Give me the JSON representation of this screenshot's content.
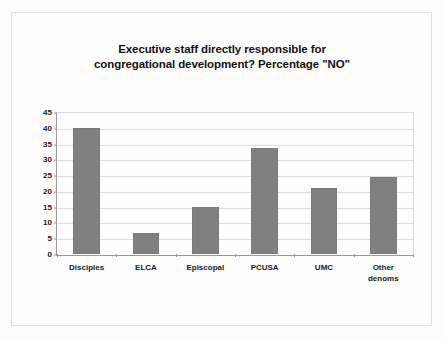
{
  "chart_data": {
    "type": "bar",
    "title": "Executive staff directly responsible for congregational development? Percentage \"NO\"",
    "title_lines": [
      "Executive staff directly responsible for",
      "congregational development? Percentage \"NO\""
    ],
    "xlabel": "",
    "ylabel": "",
    "categories": [
      "Disciples",
      "ELCA",
      "Episcopal",
      "PCUSA",
      "UMC",
      "Other denoms"
    ],
    "category_lines": [
      [
        "Disciples"
      ],
      [
        "ELCA"
      ],
      [
        "Episcopal"
      ],
      [
        "PCUSA"
      ],
      [
        "UMC"
      ],
      [
        "Other",
        "denoms"
      ]
    ],
    "values": [
      40,
      6.8,
      15,
      33.5,
      20.8,
      24.5
    ],
    "ylim": [
      0,
      45
    ],
    "ytick_labels": [
      "45",
      "40",
      "35",
      "30",
      "25",
      "20",
      "15",
      "10",
      "5",
      "0"
    ],
    "ytick_values": [
      45,
      40,
      35,
      30,
      25,
      20,
      15,
      10,
      5,
      0
    ],
    "ytick_step": 5,
    "grid": true,
    "legend": false,
    "bar_color": "#808080",
    "grid_color": "#dedede",
    "axis_color": "#9a9a9a",
    "background_color": "#fdfdfc"
  }
}
